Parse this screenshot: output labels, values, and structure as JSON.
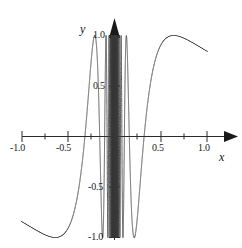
{
  "figure": {
    "axis_x_name": "x",
    "axis_y_name": "y",
    "x_tick_labels": [
      "-1.0",
      "-0.5",
      "0.5",
      "1.0"
    ],
    "y_tick_labels": [
      "1.0",
      "0.5",
      "-0.5",
      "-1.0"
    ],
    "curve_color": "#3a3a3a",
    "axis_color": "#2b2b2b"
  },
  "labels": {
    "x_neg_1": "-1.0",
    "x_neg_0_5": "-0.5",
    "x_pos_0_5": "0.5",
    "x_pos_1": "1.0",
    "y_pos_1": "1.0",
    "y_pos_0_5": "0.5",
    "y_neg_0_5": "-0.5",
    "y_neg_1": "-1.0",
    "x_axis": "x",
    "y_axis": "y"
  },
  "chart_data": {
    "type": "line",
    "title": "",
    "xlabel": "x",
    "ylabel": "y",
    "xlim": [
      -1.05,
      1.05
    ],
    "ylim": [
      -1.05,
      1.05
    ],
    "grid": false,
    "legend": null,
    "function": "sin(1/x)",
    "x_major_ticks": [
      -1.0,
      -0.5,
      0.5,
      1.0
    ],
    "x_minor_ticks": [
      -0.75,
      -0.25,
      0.25,
      0.75
    ],
    "y_major_ticks": [
      1.0,
      0.5,
      -0.5,
      -1.0
    ],
    "y_minor_ticks": [
      0.75,
      0.25,
      -0.25,
      -0.75
    ],
    "sample_points": [
      {
        "x": -1.0,
        "y": -0.841
      },
      {
        "x": -0.9,
        "y": -0.891
      },
      {
        "x": -0.8,
        "y": -0.949
      },
      {
        "x": -0.7,
        "y": -0.99
      },
      {
        "x": -0.6,
        "y": -0.995
      },
      {
        "x": -0.55,
        "y": -0.982
      },
      {
        "x": -0.5,
        "y": -0.909
      },
      {
        "x": -0.45,
        "y": -0.793
      },
      {
        "x": -0.4,
        "y": -0.598
      },
      {
        "x": -0.37,
        "y": -0.43
      },
      {
        "x": -0.35,
        "y": -0.296
      },
      {
        "x": -0.3183,
        "y": 0.0
      },
      {
        "x": -0.3,
        "y": 0.19
      },
      {
        "x": -0.28,
        "y": 0.435
      },
      {
        "x": -0.26,
        "y": 0.685
      },
      {
        "x": -0.24,
        "y": 0.893
      },
      {
        "x": -0.22,
        "y": 0.996
      },
      {
        "x": -0.2122,
        "y": 1.0
      },
      {
        "x": -0.2,
        "y": 0.959
      },
      {
        "x": -0.18,
        "y": 0.745
      },
      {
        "x": -0.17,
        "y": 0.57
      },
      {
        "x": -0.16,
        "y": 0.339
      },
      {
        "x": -0.1592,
        "y": 0.0
      },
      {
        "x": -0.15,
        "y": -0.19
      },
      {
        "x": -0.14,
        "y": -0.522
      },
      {
        "x": -0.13,
        "y": -0.854
      },
      {
        "x": -0.1273,
        "y": -1.0
      },
      {
        "x": -0.12,
        "y": -0.878
      },
      {
        "x": -0.11,
        "y": -0.4
      },
      {
        "x": -0.1061,
        "y": 0.0
      },
      {
        "x": -0.1,
        "y": 0.544
      },
      {
        "x": -0.0909,
        "y": 1.0
      },
      {
        "x": -0.08,
        "y": 0.666
      },
      {
        "x": -0.0796,
        "y": 0.0
      },
      {
        "x": -0.07,
        "y": -0.999
      },
      {
        "x": -0.0637,
        "y": 0.0
      },
      {
        "x": -0.06,
        "y": 0.823
      },
      {
        "x": -0.0531,
        "y": 0.0
      },
      {
        "x": -0.05,
        "y": -0.912
      },
      {
        "x": -0.04,
        "y": 0.745
      },
      {
        "x": -0.03,
        "y": -0.312
      },
      {
        "x": -0.02,
        "y": -0.262
      },
      {
        "x": -0.01,
        "y": 0.506
      },
      {
        "x": 0.01,
        "y": -0.506
      },
      {
        "x": 0.02,
        "y": 0.262
      },
      {
        "x": 0.03,
        "y": 0.312
      },
      {
        "x": 0.04,
        "y": -0.745
      },
      {
        "x": 0.05,
        "y": 0.912
      },
      {
        "x": 0.0531,
        "y": 0.0
      },
      {
        "x": 0.06,
        "y": -0.823
      },
      {
        "x": 0.0637,
        "y": 0.0
      },
      {
        "x": 0.07,
        "y": 0.999
      },
      {
        "x": 0.0796,
        "y": 0.0
      },
      {
        "x": 0.08,
        "y": -0.666
      },
      {
        "x": 0.0909,
        "y": -1.0
      },
      {
        "x": 0.1,
        "y": -0.544
      },
      {
        "x": 0.1061,
        "y": 0.0
      },
      {
        "x": 0.11,
        "y": 0.4
      },
      {
        "x": 0.12,
        "y": 0.878
      },
      {
        "x": 0.1273,
        "y": 1.0
      },
      {
        "x": 0.13,
        "y": 0.854
      },
      {
        "x": 0.14,
        "y": 0.522
      },
      {
        "x": 0.15,
        "y": 0.19
      },
      {
        "x": 0.1592,
        "y": 0.0
      },
      {
        "x": 0.16,
        "y": -0.339
      },
      {
        "x": 0.17,
        "y": -0.57
      },
      {
        "x": 0.18,
        "y": -0.745
      },
      {
        "x": 0.2,
        "y": -0.959
      },
      {
        "x": 0.2122,
        "y": -1.0
      },
      {
        "x": 0.22,
        "y": -0.996
      },
      {
        "x": 0.24,
        "y": -0.893
      },
      {
        "x": 0.26,
        "y": -0.685
      },
      {
        "x": 0.28,
        "y": -0.435
      },
      {
        "x": 0.3,
        "y": -0.19
      },
      {
        "x": 0.3183,
        "y": 0.0
      },
      {
        "x": 0.35,
        "y": 0.296
      },
      {
        "x": 0.4,
        "y": 0.598
      },
      {
        "x": 0.45,
        "y": 0.793
      },
      {
        "x": 0.5,
        "y": 0.909
      },
      {
        "x": 0.55,
        "y": 0.982
      },
      {
        "x": 0.6,
        "y": 0.995
      },
      {
        "x": 0.65,
        "y": 0.999
      },
      {
        "x": 0.7,
        "y": 0.99
      },
      {
        "x": 0.8,
        "y": 0.949
      },
      {
        "x": 0.9,
        "y": 0.891
      },
      {
        "x": 1.0,
        "y": 0.841
      }
    ]
  }
}
